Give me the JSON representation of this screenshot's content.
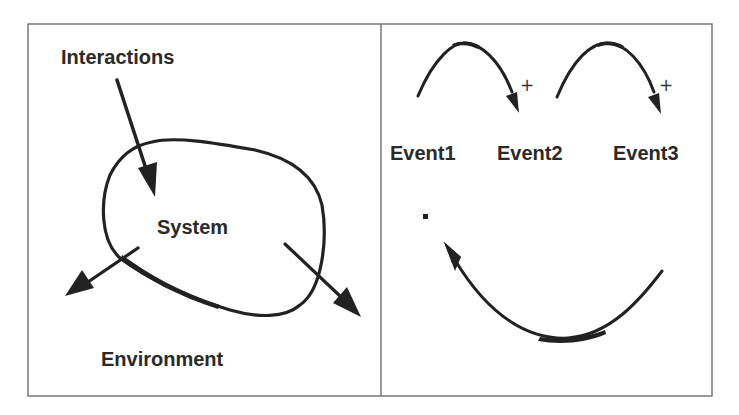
{
  "left_panel": {
    "interactions_label": "Interactions",
    "system_label": "System",
    "environment_label": "Environment"
  },
  "right_panel": {
    "events": [
      {
        "label": "Event1"
      },
      {
        "label": "Event2"
      },
      {
        "label": "Event3"
      }
    ],
    "plus_marks": [
      "+",
      "+"
    ]
  },
  "colors": {
    "ink": "#222222",
    "frame": "#6e6e6e",
    "background": "#ffffff"
  }
}
